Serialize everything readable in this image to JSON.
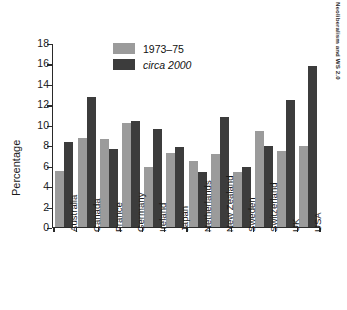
{
  "running_head": "Neoliberalism and WS 2.0",
  "chart_data": {
    "type": "bar",
    "title": "",
    "xlabel": "",
    "ylabel": "Percentage",
    "ylim": [
      0,
      18
    ],
    "yticks": [
      0,
      2,
      4,
      6,
      8,
      10,
      12,
      14,
      16,
      18
    ],
    "ytick_labels": [
      "0",
      "2",
      "4",
      "6",
      "8",
      "10",
      "12",
      "14",
      "16",
      "18"
    ],
    "grid": false,
    "legend_position": "top-center",
    "categories": [
      "Australia",
      "Canada",
      "France",
      "Germany",
      "Ireland",
      "Japan",
      "Netherlands",
      "New Zealand",
      "Sweden",
      "Switzerland",
      "UK",
      "USA"
    ],
    "series": [
      {
        "name": "1973–75",
        "color": "#9b9b9b",
        "italic": false,
        "values": [
          5.45,
          8.7,
          8.6,
          10.2,
          5.85,
          7.25,
          6.45,
          7.2,
          5.35,
          9.4,
          7.45,
          7.9
        ]
      },
      {
        "name": "circa 2000",
        "color": "#3c3c3c",
        "italic": true,
        "values": [
          8.3,
          12.8,
          7.65,
          10.4,
          9.6,
          7.8,
          5.35,
          10.8,
          5.9,
          7.95,
          12.5,
          15.85
        ]
      }
    ]
  }
}
